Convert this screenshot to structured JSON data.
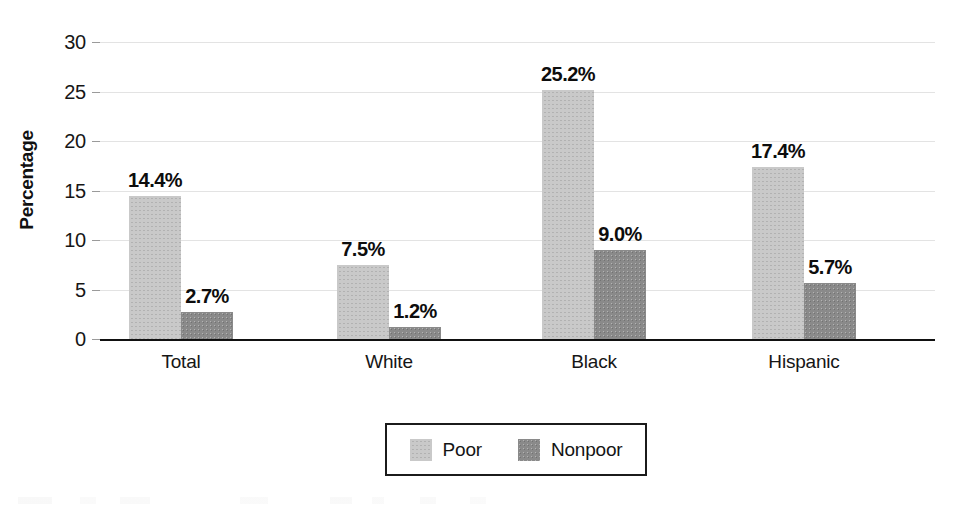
{
  "chart_data": {
    "type": "bar",
    "title": "",
    "xlabel": "",
    "ylabel": "Percentage",
    "ylim": [
      0,
      30
    ],
    "yticks": [
      0,
      5,
      10,
      15,
      20,
      25,
      30
    ],
    "ytick_labels": [
      "0",
      "5",
      "10",
      "15",
      "20",
      "25",
      "30"
    ],
    "grid": true,
    "legend_position": "bottom-center",
    "categories": [
      "Total",
      "White",
      "Black",
      "Hispanic"
    ],
    "series": [
      {
        "name": "Poor",
        "color": "#c9c9c9",
        "values": [
          14.4,
          7.5,
          25.2,
          17.4
        ],
        "value_labels": [
          "14.4%",
          "7.5%",
          "25.2%",
          "17.4%"
        ]
      },
      {
        "name": "Nonpoor",
        "color": "#8a8a8a",
        "values": [
          2.7,
          1.2,
          9.0,
          5.7
        ],
        "value_labels": [
          "2.7%",
          "1.2%",
          "9.0%",
          "5.7%"
        ]
      }
    ]
  },
  "legend": {
    "items": [
      {
        "label": "Poor",
        "swatch": "legend-swatch-poor"
      },
      {
        "label": "Nonpoor",
        "swatch": "legend-swatch-nonpoor"
      }
    ]
  },
  "colors": {
    "poor": "#c9c9c9",
    "nonpoor": "#8a8a8a",
    "axis": "#111111",
    "grid": "#e3e3e3",
    "text": "#161616",
    "background": "#ffffff"
  }
}
